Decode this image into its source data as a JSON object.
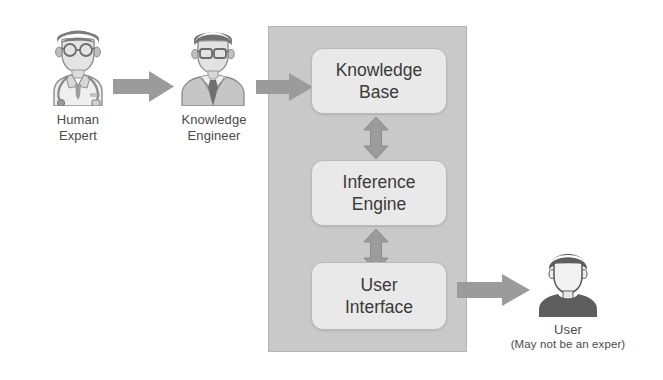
{
  "diagram": {
    "type": "block-diagram",
    "colors": {
      "panel_fill": "#c9c9c9",
      "panel_border": "#b4b4b4",
      "box_fill": "#e9e9e9",
      "box_border": "#b9b9b9",
      "arrow_fill": "#9b9b9b",
      "text": "#3b3b3b",
      "expert_figure": "#8f8f8f",
      "engineer_figure": "#8a8a8a",
      "user_figure": "#5e5e5e"
    },
    "actors": [
      {
        "id": "human-expert",
        "icon": "doctor-avatar-icon",
        "caption": "Human\nExpert"
      },
      {
        "id": "knowledge-engineer",
        "icon": "engineer-avatar-icon",
        "caption": "Knowledge\nEngineer"
      },
      {
        "id": "end-user",
        "icon": "user-avatar-icon",
        "caption_primary": "User",
        "caption_secondary": "(May not be an exper)"
      }
    ],
    "system_panel": {
      "label": "",
      "components": [
        {
          "id": "knowledge-base",
          "label": "Knowledge\nBase"
        },
        {
          "id": "inference-engine",
          "label": "Inference\nEngine"
        },
        {
          "id": "user-interface",
          "label": "User\nInterface"
        }
      ]
    },
    "arrows": [
      {
        "id": "expert-to-engineer",
        "icon": "right-block-arrow-icon",
        "direction": "right",
        "from": "human-expert",
        "to": "knowledge-engineer"
      },
      {
        "id": "engineer-to-kb",
        "icon": "right-block-arrow-icon",
        "direction": "right",
        "from": "knowledge-engineer",
        "to": "knowledge-base"
      },
      {
        "id": "kb-to-inference",
        "icon": "double-vertical-arrow-icon",
        "direction": "bidirectional",
        "from": "knowledge-base",
        "to": "inference-engine"
      },
      {
        "id": "inference-to-ui",
        "icon": "double-vertical-arrow-icon",
        "direction": "bidirectional",
        "from": "inference-engine",
        "to": "user-interface"
      },
      {
        "id": "ui-to-user",
        "icon": "right-block-arrow-icon",
        "direction": "right",
        "from": "user-interface",
        "to": "end-user"
      }
    ]
  }
}
